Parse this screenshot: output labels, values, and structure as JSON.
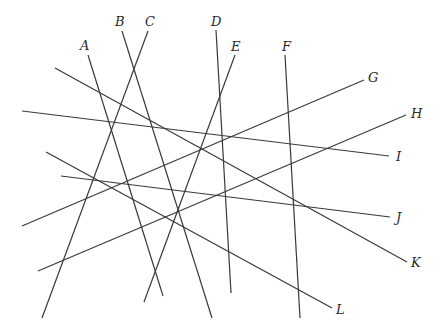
{
  "diagram": {
    "type": "line-arrangement",
    "line_color": "#3a3a3a",
    "background": "#ffffff",
    "lines": [
      {
        "label": "A",
        "x1": 88,
        "y1": 55,
        "x2": 163,
        "y2": 296,
        "label_x": 80,
        "label_y": 50
      },
      {
        "label": "B",
        "x1": 122,
        "y1": 31,
        "x2": 212,
        "y2": 318,
        "label_x": 115,
        "label_y": 26
      },
      {
        "label": "C",
        "x1": 148,
        "y1": 31,
        "x2": 42,
        "y2": 318,
        "label_x": 145,
        "label_y": 26
      },
      {
        "label": "D",
        "x1": 216,
        "y1": 30,
        "x2": 231,
        "y2": 293,
        "label_x": 211,
        "label_y": 26
      },
      {
        "label": "E",
        "x1": 235,
        "y1": 55,
        "x2": 144,
        "y2": 302,
        "label_x": 231,
        "label_y": 51
      },
      {
        "label": "F",
        "x1": 285,
        "y1": 55,
        "x2": 300,
        "y2": 318,
        "label_x": 282,
        "label_y": 51
      },
      {
        "label": "G",
        "x1": 364,
        "y1": 80,
        "x2": 22,
        "y2": 226,
        "label_x": 368,
        "label_y": 82
      },
      {
        "label": "H",
        "x1": 406,
        "y1": 115,
        "x2": 38,
        "y2": 271,
        "label_x": 411,
        "label_y": 118
      },
      {
        "label": "I",
        "x1": 22,
        "y1": 111,
        "x2": 389,
        "y2": 156,
        "label_x": 396,
        "label_y": 161
      },
      {
        "label": "J",
        "x1": 61,
        "y1": 176,
        "x2": 390,
        "y2": 217,
        "label_x": 396,
        "label_y": 222
      },
      {
        "label": "K",
        "x1": 55,
        "y1": 68,
        "x2": 407,
        "y2": 262,
        "label_x": 411,
        "label_y": 267
      },
      {
        "label": "L",
        "x1": 46,
        "y1": 152,
        "x2": 332,
        "y2": 308,
        "label_x": 336,
        "label_y": 314
      }
    ]
  }
}
